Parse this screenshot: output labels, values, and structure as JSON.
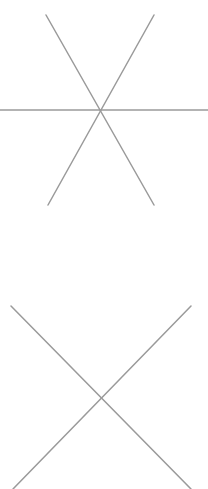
{
  "canvas": {
    "width": 208,
    "height": 489,
    "background": "#ffffff",
    "line_color": "#9a9a9a",
    "line_width": 1.5
  },
  "figures": [
    {
      "name": "six-line-asterisk",
      "center": [
        100,
        110
      ],
      "lines": [
        {
          "x1": 0,
          "y1": 110,
          "x2": 208,
          "y2": 110
        },
        {
          "x1": 46,
          "y1": 15,
          "x2": 154,
          "y2": 205
        },
        {
          "x1": 154,
          "y1": 15,
          "x2": 48,
          "y2": 205
        }
      ]
    },
    {
      "name": "x-cross",
      "center": [
        100,
        398
      ],
      "lines": [
        {
          "x1": 11,
          "y1": 306,
          "x2": 191,
          "y2": 489
        },
        {
          "x1": 191,
          "y1": 306,
          "x2": 13,
          "y2": 489
        }
      ]
    }
  ]
}
